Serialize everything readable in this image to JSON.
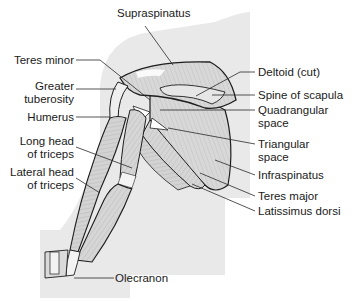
{
  "diagram": {
    "colors": {
      "background": "#ffffff",
      "silhouette": "#e9e9e9",
      "muscle_fill": "#d4d4d4",
      "muscle_light": "#eeeeee",
      "outline": "#1e1e1e",
      "leader_line": "#2a2a2a",
      "text": "#1a1a1a"
    },
    "labels_left": [
      {
        "id": "teres-minor",
        "line1": "Teres minor",
        "line2": ""
      },
      {
        "id": "greater-tuberosity",
        "line1": "Greater",
        "line2": "tuberosity"
      },
      {
        "id": "humerus",
        "line1": "Humerus",
        "line2": ""
      },
      {
        "id": "long-head-triceps",
        "line1": "Long head",
        "line2": "of triceps"
      },
      {
        "id": "lateral-head-triceps",
        "line1": "Lateral head",
        "line2": "of triceps"
      }
    ],
    "labels_top": [
      {
        "id": "supraspinatus",
        "line1": "Supraspinatus"
      }
    ],
    "labels_right": [
      {
        "id": "deltoid-cut",
        "line1": "Deltoid (cut)",
        "line2": ""
      },
      {
        "id": "spine-of-scapula",
        "line1": "Spine of scapula",
        "line2": ""
      },
      {
        "id": "quadrangular-space",
        "line1": "Quadrangular",
        "line2": "space"
      },
      {
        "id": "triangular-space",
        "line1": "Triangular",
        "line2": "space"
      },
      {
        "id": "infraspinatus",
        "line1": "Infraspinatus",
        "line2": ""
      },
      {
        "id": "teres-major",
        "line1": "Teres major",
        "line2": ""
      },
      {
        "id": "latissimus-dorsi",
        "line1": "Latissimus dorsi",
        "line2": ""
      }
    ],
    "labels_bottom": [
      {
        "id": "olecranon",
        "line1": "Olecranon"
      }
    ]
  }
}
